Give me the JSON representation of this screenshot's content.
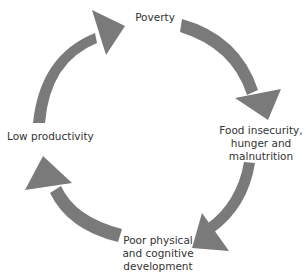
{
  "diagram": {
    "type": "cycle",
    "arrow_color": "#7a7a7a",
    "nodes": [
      {
        "id": "poverty",
        "label": "Poverty"
      },
      {
        "id": "food",
        "lines": [
          "Food insecurity,",
          "hunger and",
          "malnutrition"
        ]
      },
      {
        "id": "development",
        "lines": [
          "Poor physical",
          "and cognitive",
          "development"
        ]
      },
      {
        "id": "productivity",
        "label": "Low productivity"
      }
    ],
    "edges": [
      {
        "from": "poverty",
        "to": "food"
      },
      {
        "from": "food",
        "to": "development"
      },
      {
        "from": "development",
        "to": "productivity"
      },
      {
        "from": "productivity",
        "to": "poverty"
      }
    ]
  }
}
